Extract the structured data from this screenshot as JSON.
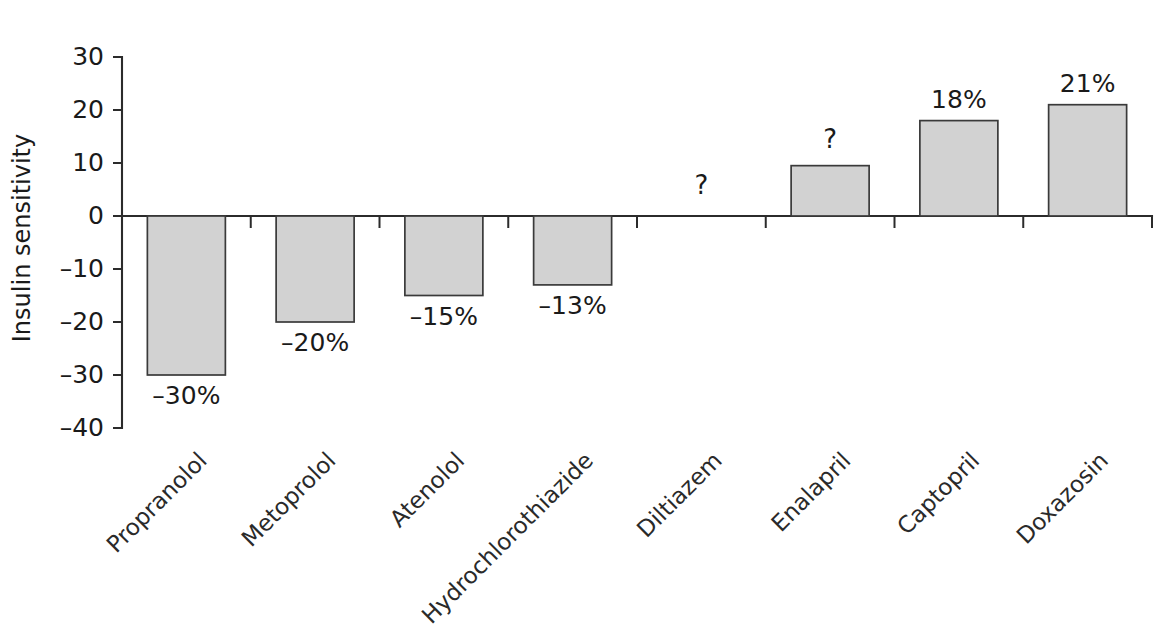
{
  "chart_data": {
    "type": "bar",
    "title": "",
    "subtitle": "",
    "xlabel": "",
    "ylabel": "Insulin sensitivity",
    "ylim": [
      -40,
      30
    ],
    "ytick_values": [
      30,
      20,
      10,
      0,
      -10,
      -20,
      -30,
      -40
    ],
    "ytick_labels": [
      "30",
      "20",
      "10",
      "0",
      "–10",
      "–20",
      "–30",
      "–40"
    ],
    "grid": false,
    "legend": false,
    "legend_position": "none",
    "zero_line": 0,
    "categories": [
      "Propranolol",
      "Metoprolol",
      "Atenolol",
      "Hydrochlorothiazide",
      "Diltiazem",
      "Enalapril",
      "Captopril",
      "Doxazosin"
    ],
    "values": [
      -30,
      -20,
      -15,
      -13,
      null,
      9.5,
      18,
      21
    ],
    "data_labels": [
      "–30%",
      "–20%",
      "–15%",
      "–13%",
      "?",
      "?",
      "18%",
      "21%"
    ],
    "bars": [
      {
        "category": "Propranolol",
        "value": -30,
        "label": "–30%",
        "has_bar": true,
        "unknown": false
      },
      {
        "category": "Metoprolol",
        "value": -20,
        "label": "–20%",
        "has_bar": true,
        "unknown": false
      },
      {
        "category": "Atenolol",
        "value": -15,
        "label": "–15%",
        "has_bar": true,
        "unknown": false
      },
      {
        "category": "Hydrochlorothiazide",
        "value": -13,
        "label": "–13%",
        "has_bar": true,
        "unknown": false
      },
      {
        "category": "Diltiazem",
        "value": null,
        "label": "?",
        "has_bar": false,
        "unknown": true
      },
      {
        "category": "Enalapril",
        "value": 9.5,
        "label": "?",
        "has_bar": true,
        "unknown": true
      },
      {
        "category": "Captopril",
        "value": 18,
        "label": "18%",
        "has_bar": true,
        "unknown": false
      },
      {
        "category": "Doxazosin",
        "value": 21,
        "label": "21%",
        "has_bar": true,
        "unknown": false
      }
    ],
    "colors": {
      "bar_fill": "#d2d2d2",
      "bar_stroke": "#3a3a3a",
      "axis": "#2b2b2b",
      "text": "#1a1a1a",
      "background": "#ffffff"
    },
    "label_rotation_deg": -45
  }
}
